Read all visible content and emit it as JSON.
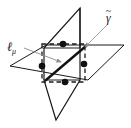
{
  "figure": {
    "background_color": "#ffffff",
    "stroke_color": "#1a1a1a",
    "leader_color": "#9a9a9a"
  },
  "labels": {
    "line_label": "ℓ",
    "line_label_subscript": "μ",
    "curve_label": "γ",
    "curve_label_accent": "~"
  },
  "geometry": {
    "horizontal_plane": {
      "name": "horizontal-plane",
      "points": "10,66 46,45 124,45 88,80",
      "note": "parallelogram drawn in perspective"
    },
    "vertical_plane": {
      "name": "vertical-plane",
      "points": "44,48 80,8 80,80 56,120 44,120",
      "note": "slanted parallelogram pierced through the horizontal plane"
    },
    "dashed_square": {
      "name": "dashed-square",
      "points": "42,44 85,44 85,82 42,82"
    },
    "bold_line": {
      "name": "bold-diagonal-line",
      "x1": 46,
      "y1": 80,
      "x2": 86,
      "y2": 46
    },
    "dots": [
      {
        "name": "point-top",
        "cx": 63,
        "cy": 44,
        "r": 3.3
      },
      {
        "name": "point-left",
        "cx": 42,
        "cy": 66,
        "r": 3.3
      },
      {
        "name": "point-right",
        "cx": 84,
        "cy": 64,
        "r": 3.3
      },
      {
        "name": "point-bottom",
        "cx": 65,
        "cy": 82,
        "r": 3.3
      }
    ],
    "leaders": [
      {
        "name": "leader-ell-mu",
        "x1": 24,
        "y1": 48,
        "x2": 62,
        "y2": 63,
        "arrow": true
      },
      {
        "name": "leader-gamma",
        "x1": 108,
        "y1": 24,
        "x2": 84,
        "y2": 48,
        "arrow": true
      }
    ]
  }
}
